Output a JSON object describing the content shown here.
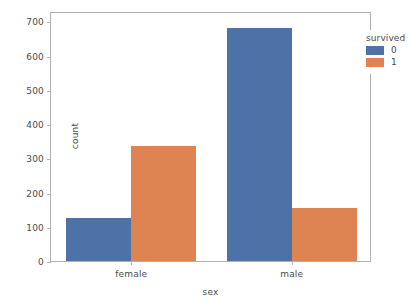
{
  "top_clipped_text": "",
  "chart_data": {
    "type": "bar",
    "title": "",
    "xlabel": "sex",
    "ylabel": "count",
    "categories": [
      "female",
      "male"
    ],
    "series": [
      {
        "name": "0",
        "color": "#4c72a8",
        "values": [
          125,
          680
        ]
      },
      {
        "name": "1",
        "color": "#dd8452",
        "values": [
          335,
          155
        ]
      }
    ],
    "legend": {
      "title": "survived",
      "position": "upper right",
      "entries": [
        {
          "label": "0",
          "color": "#4c72a8"
        },
        {
          "label": "1",
          "color": "#dd8452"
        }
      ]
    },
    "ylim": [
      0,
      730
    ],
    "yticks": [
      0,
      100,
      200,
      300,
      400,
      500,
      600,
      700
    ],
    "ytick_labels": [
      "0",
      "100",
      "200",
      "300",
      "400",
      "500",
      "600",
      "700"
    ],
    "xtick_labels": [
      "female",
      "male"
    ],
    "grid": false,
    "axis_color": "#b0b0b4",
    "background": "#ffffff"
  }
}
